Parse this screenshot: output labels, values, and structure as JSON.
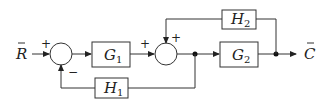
{
  "diagram": {
    "type": "block-diagram",
    "input": {
      "symbol": "R",
      "accent": "̄",
      "label": "R̄"
    },
    "output": {
      "symbol": "C",
      "accent": "̄",
      "label": "C̄"
    },
    "summing_junctions": [
      {
        "id": "S1",
        "signs": {
          "left": "+",
          "bottom": "−"
        }
      },
      {
        "id": "S2",
        "signs": {
          "left": "+",
          "top": "+"
        }
      }
    ],
    "blocks": [
      {
        "id": "G1",
        "name": "G",
        "sub": "1",
        "path": "forward"
      },
      {
        "id": "G2",
        "name": "G",
        "sub": "2",
        "path": "forward"
      },
      {
        "id": "H1",
        "name": "H",
        "sub": "1",
        "path": "feedback"
      },
      {
        "id": "H2",
        "name": "H",
        "sub": "2",
        "path": "feedback"
      }
    ],
    "connections": [
      "R -> S1(+)",
      "S1 -> G1",
      "G1 -> S2(+)",
      "S2 -> node1",
      "node1 -> G2",
      "G2 -> node2",
      "node2 -> C",
      "node1 -> H1 -> S1(-)",
      "node2 -> H2 -> S2(+)"
    ],
    "colors": {
      "stroke": "#333333",
      "text": "#222222",
      "background": "#ffffff"
    }
  }
}
